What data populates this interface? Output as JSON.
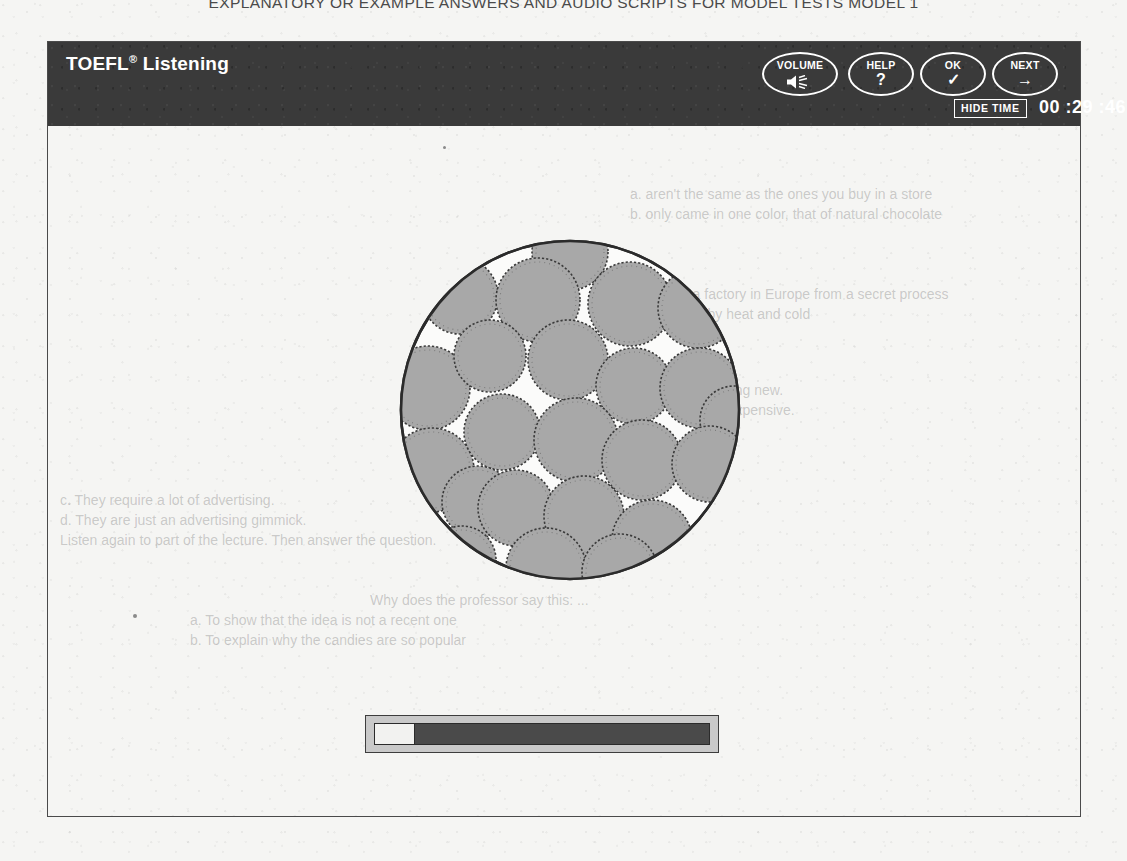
{
  "page": {
    "running_head": "EXPLANATORY OR EXAMPLE ANSWERS AND AUDIO SCRIPTS FOR MODEL TESTS MODEL 1",
    "background_color": "#f5f5f3"
  },
  "window": {
    "title": "TOEFL",
    "title_superscript": "®",
    "section": "Listening",
    "header_color": "#3a3a3a",
    "border_color": "#4a4a4a"
  },
  "toolbar": {
    "buttons": [
      {
        "name": "volume",
        "label": "VOLUME",
        "glyph": "speaker-icon"
      },
      {
        "name": "help",
        "label": "HELP",
        "glyph": "?"
      },
      {
        "name": "ok",
        "label": "OK",
        "glyph": "✓"
      },
      {
        "name": "next",
        "label": "NEXT",
        "glyph": "→"
      }
    ],
    "hide_time_label": "HIDE TIME",
    "timer": "00 :29 :46"
  },
  "content": {
    "figure": {
      "name": "microscope-field-of-cells",
      "description": "Large outlined circle filled with many shaded round cells",
      "outline_color": "#2b2b2b",
      "cell_fill": "#a8a8a8",
      "cell_outline": "#3a3a3a",
      "cells": [
        {
          "cx": 172,
          "cy": 14,
          "r": 38
        },
        {
          "cx": 62,
          "cy": 58,
          "r": 38
        },
        {
          "cx": 140,
          "cy": 62,
          "r": 42
        },
        {
          "cx": 232,
          "cy": 66,
          "r": 42
        },
        {
          "cx": 300,
          "cy": 70,
          "r": 40
        },
        {
          "cx": 30,
          "cy": 150,
          "r": 42
        },
        {
          "cx": 92,
          "cy": 118,
          "r": 36
        },
        {
          "cx": 170,
          "cy": 122,
          "r": 40
        },
        {
          "cx": 236,
          "cy": 148,
          "r": 38
        },
        {
          "cx": 302,
          "cy": 150,
          "r": 40
        },
        {
          "cx": 336,
          "cy": 182,
          "r": 34
        },
        {
          "cx": 34,
          "cy": 232,
          "r": 42
        },
        {
          "cx": 104,
          "cy": 194,
          "r": 38
        },
        {
          "cx": 178,
          "cy": 202,
          "r": 42
        },
        {
          "cx": 244,
          "cy": 222,
          "r": 40
        },
        {
          "cx": 312,
          "cy": 226,
          "r": 38
        },
        {
          "cx": 80,
          "cy": 264,
          "r": 36
        },
        {
          "cx": 118,
          "cy": 270,
          "r": 38
        },
        {
          "cx": 186,
          "cy": 278,
          "r": 40
        },
        {
          "cx": 254,
          "cy": 302,
          "r": 40
        },
        {
          "cx": 148,
          "cy": 330,
          "r": 40
        },
        {
          "cx": 222,
          "cy": 334,
          "r": 38
        },
        {
          "cx": 64,
          "cy": 322,
          "r": 34
        }
      ]
    },
    "audio_player": {
      "name": "audio-progress-bar",
      "progress_percent": 12,
      "track_color": "#4a4a4a",
      "fill_color": "#f2f2f0",
      "frame_color": "#c9c9c9"
    }
  },
  "bleed_through": {
    "lines": [
      "a. aren't the same as the ones you buy in a store",
      "b. only came in one color, that of natural chocolate",
      "c. are made in a factory in Europe from a secret process",
      "d. aren't affected by heat and cold",
      "a. They are nothing new.",
      "b. They are too expensive.",
      "c. They require a lot of advertising.",
      "d. They are just an advertising gimmick.",
      "Listen again to part of the lecture. Then answer the question.",
      "Why does the professor say this: ...",
      "a. To show that the idea is not a recent one",
      "b. To explain why the candies are so popular",
      "c. To suggest that the method was abandoned"
    ]
  }
}
